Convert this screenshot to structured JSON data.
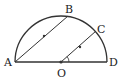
{
  "figure": {
    "points": {
      "A": {
        "label": "A"
      },
      "B": {
        "label": "B"
      },
      "C": {
        "label": "C"
      },
      "D": {
        "label": "D"
      },
      "O": {
        "label": "O"
      }
    },
    "colors": {
      "stroke": "#333333",
      "background": "#ffffff"
    }
  }
}
